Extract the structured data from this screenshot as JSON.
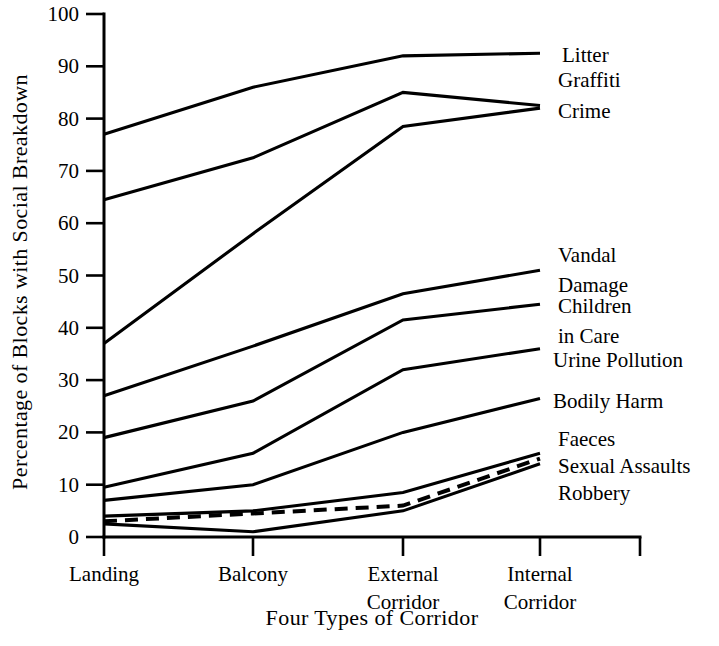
{
  "chart_data": {
    "type": "line",
    "title": "",
    "xlabel": "Four Types of Corridor",
    "ylabel": "Percentage of Blocks with Social Breakdown",
    "categories": [
      "Landing",
      "Balcony",
      "External Corridor",
      "Internal Corridor"
    ],
    "category_lines": [
      [
        "Landing"
      ],
      [
        "Balcony"
      ],
      [
        "External",
        "Corridor"
      ],
      [
        "Internal",
        "Corridor"
      ]
    ],
    "ylim": [
      0,
      100
    ],
    "yticks": [
      0,
      10,
      20,
      30,
      40,
      50,
      60,
      70,
      80,
      90,
      100
    ],
    "ytick_labels": [
      "0",
      "10",
      "20",
      "30",
      "40",
      "50",
      "60",
      "70",
      "80",
      "90",
      "100"
    ],
    "grid": false,
    "legend_position": "right-inline-labels",
    "series": [
      {
        "name": "Litter",
        "values": [
          77,
          86,
          92,
          92.5
        ],
        "style": "solid",
        "label_lines": [
          "Litter"
        ]
      },
      {
        "name": "Graffiti",
        "values": [
          64.5,
          72.5,
          85,
          82.5
        ],
        "style": "solid",
        "label_lines": [
          "Graffiti"
        ]
      },
      {
        "name": "Crime",
        "values": [
          37,
          58,
          78.5,
          82
        ],
        "style": "solid",
        "label_lines": [
          "Crime"
        ]
      },
      {
        "name": "Vandal Damage",
        "values": [
          27,
          36.5,
          46.5,
          51
        ],
        "style": "solid",
        "label_lines": [
          "Vandal",
          "Damage"
        ]
      },
      {
        "name": "Children in Care",
        "values": [
          19,
          26,
          41.5,
          44.5
        ],
        "style": "solid",
        "label_lines": [
          "Children",
          "in Care"
        ]
      },
      {
        "name": "Urine Pollution",
        "values": [
          9.5,
          16,
          32,
          36
        ],
        "style": "solid",
        "label_lines": [
          "Urine Pollution"
        ]
      },
      {
        "name": "Bodily Harm",
        "values": [
          7,
          10,
          20,
          26.5
        ],
        "style": "solid",
        "label_lines": [
          "Bodily Harm"
        ]
      },
      {
        "name": "Faeces",
        "values": [
          3,
          4.5,
          6,
          15
        ],
        "style": "dashed",
        "label_lines": [
          "Faeces"
        ]
      },
      {
        "name": "Sexual Assaults",
        "values": [
          4,
          5,
          8.5,
          16
        ],
        "style": "solid",
        "label_lines": [
          "Sexual Assaults"
        ]
      },
      {
        "name": "Robbery",
        "values": [
          2.5,
          1,
          5,
          14
        ],
        "style": "solid",
        "label_lines": [
          "Robbery"
        ]
      }
    ],
    "label_positions": [
      {
        "name": "Litter",
        "lines": [
          "Litter"
        ],
        "x": 562,
        "y": 62
      },
      {
        "name": "Graffiti",
        "lines": [
          "Graffiti"
        ],
        "x": 558,
        "y": 87
      },
      {
        "name": "Crime",
        "lines": [
          "Crime"
        ],
        "x": 558,
        "y": 118
      },
      {
        "name": "Vandal Damage",
        "lines": [
          "Vandal",
          "Damage"
        ],
        "x": 558,
        "y": 262
      },
      {
        "name": "Children in Care",
        "lines": [
          "Children",
          "in Care"
        ],
        "x": 558,
        "y": 313
      },
      {
        "name": "Urine Pollution",
        "lines": [
          "Urine Pollution"
        ],
        "x": 553,
        "y": 367
      },
      {
        "name": "Bodily Harm",
        "lines": [
          "Bodily Harm"
        ],
        "x": 553,
        "y": 408
      },
      {
        "name": "Faeces",
        "lines": [
          "Faeces"
        ],
        "x": 558,
        "y": 446
      },
      {
        "name": "Sexual Assaults",
        "lines": [
          "Sexual Assaults"
        ],
        "x": 558,
        "y": 473
      },
      {
        "name": "Robbery",
        "lines": [
          "Robbery"
        ],
        "x": 558,
        "y": 500
      }
    ],
    "colors": {
      "line": "#000000",
      "axis": "#000000",
      "background": "#ffffff",
      "text": "#000000"
    }
  }
}
